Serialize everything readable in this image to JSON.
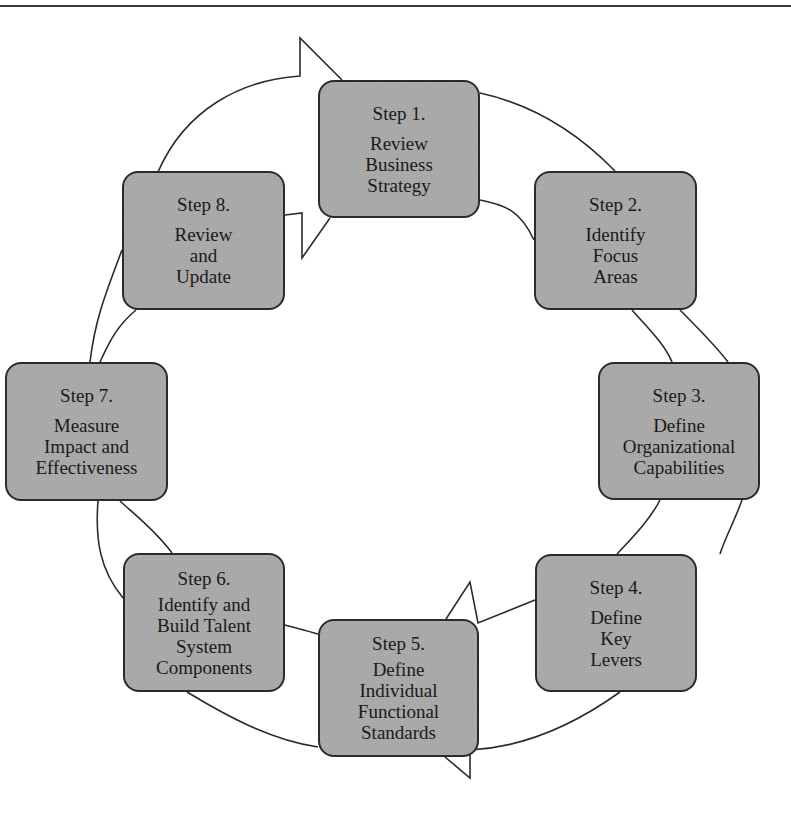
{
  "diagram": {
    "type": "cycle",
    "colors": {
      "box_fill": "#a8a8a8",
      "box_border": "#2b2b2b",
      "line": "#2b2b2b",
      "background": "#ffffff"
    },
    "steps": [
      {
        "number": "Step 1.",
        "lines": [
          "Review",
          "Business",
          "Strategy"
        ]
      },
      {
        "number": "Step 2.",
        "lines": [
          "Identify",
          "Focus",
          "Areas"
        ]
      },
      {
        "number": "Step 3.",
        "lines": [
          "Define",
          "Organizational",
          "Capabilities"
        ]
      },
      {
        "number": "Step 4.",
        "lines": [
          "Define",
          "Key",
          "Levers"
        ]
      },
      {
        "number": "Step 5.",
        "lines": [
          "Define",
          "Individual",
          "Functional",
          "Standards"
        ]
      },
      {
        "number": "Step 6.",
        "lines": [
          "Identify and",
          "Build Talent",
          "System",
          "Components"
        ]
      },
      {
        "number": "Step 7.",
        "lines": [
          "Measure",
          "Impact and",
          "Effectiveness"
        ]
      },
      {
        "number": "Step 8.",
        "lines": [
          "Review",
          "and",
          "Update"
        ]
      }
    ]
  }
}
